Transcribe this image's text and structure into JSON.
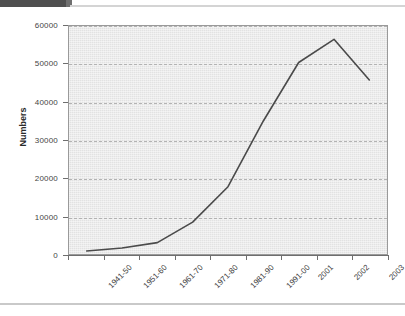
{
  "decor": {
    "top_bar_color": "#4f4f4f",
    "bottom_rule_color": "#c9c9c9"
  },
  "chart_data": {
    "type": "line",
    "title": "",
    "subtitle": "",
    "xlabel": "",
    "ylabel": "Numbers",
    "categories": [
      "1941-50",
      "1951-60",
      "1961-70",
      "1971-80",
      "1981-90",
      "1991-00",
      "2001",
      "2002",
      "2003"
    ],
    "values": [
      800,
      1600,
      3000,
      8400,
      17700,
      35000,
      50400,
      56500,
      45800
    ],
    "series": [
      {
        "name": "Numbers",
        "values": [
          800,
          1600,
          3000,
          8400,
          17700,
          35000,
          50400,
          56500,
          45800
        ],
        "color": "#4a4a4a"
      }
    ],
    "ylim": [
      0,
      60000
    ],
    "yticks": [
      0,
      10000,
      20000,
      30000,
      40000,
      50000,
      60000
    ],
    "ytick_labels": [
      "0",
      "10000",
      "20000",
      "30000",
      "40000",
      "50000",
      "60000"
    ],
    "grid": true,
    "grid_axis": "y",
    "grid_style": "dashed",
    "grid_color": "#b3b3b3",
    "legend": false,
    "legend_position": "none",
    "plot_background": "#e9e9e9",
    "plot_border_color": "#9a9a9a",
    "line_color": "#4a4a4a",
    "line_width": 1.6,
    "markers": false,
    "xtick_label_rotation": -45
  }
}
